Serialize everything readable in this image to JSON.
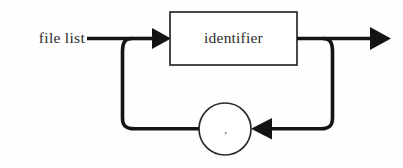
{
  "diagram": {
    "kind": "railroad-syntax-diagram",
    "title": "file list",
    "background_color": "#fefefe",
    "line_color": "#141414",
    "box_stroke_color": "#2a2a2a",
    "box_fill_color": "#ffffff",
    "text_color": "#2b2b2b",
    "entry_label": "file list",
    "nodes": [
      {
        "id": "identifier-box",
        "shape": "rectangle",
        "label": "identifier",
        "x": 170,
        "y": 12,
        "width": 127,
        "height": 53
      },
      {
        "id": "comma-circle",
        "shape": "circle",
        "label": ",",
        "cx": 225,
        "cy": 129,
        "r": 26
      }
    ],
    "arrows": [
      {
        "id": "arrow-into-identifier",
        "direction": "right",
        "x": 152,
        "y": 38
      },
      {
        "id": "arrow-exit",
        "direction": "right",
        "x": 370,
        "y": 38
      },
      {
        "id": "arrow-loopback-into-comma",
        "direction": "left",
        "x": 272,
        "y": 128
      }
    ],
    "paths": [
      {
        "id": "entry-line",
        "from": "file list label",
        "to": "split junction"
      },
      {
        "id": "main-line",
        "from": "identifier box",
        "to": "exit arrow"
      },
      {
        "id": "loop-left",
        "from": "split junction",
        "to": "comma circle"
      },
      {
        "id": "loop-right",
        "from": "merge junction",
        "to": "comma circle"
      }
    ]
  }
}
